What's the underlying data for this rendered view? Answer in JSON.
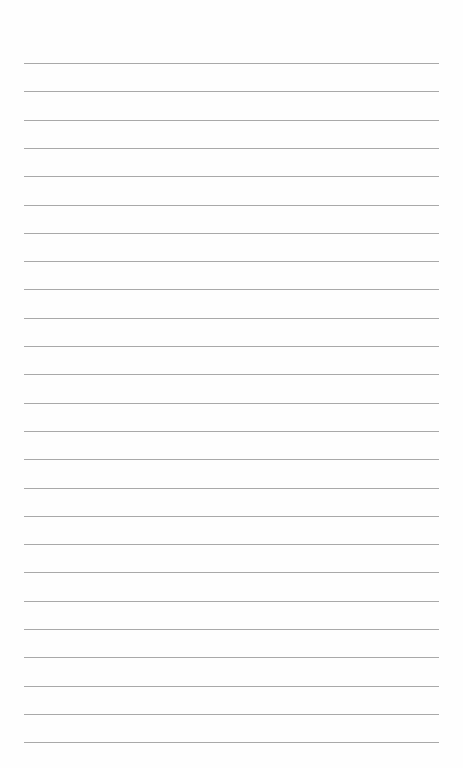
{
  "page": {
    "type": "lined-paper",
    "background_color": "#fefefe",
    "rule_color": "#a9a9a9",
    "rule_count": 25,
    "first_rule_y": 63,
    "rule_spacing": 28.3,
    "rule_left": 24,
    "rule_width": 415,
    "text": ""
  }
}
